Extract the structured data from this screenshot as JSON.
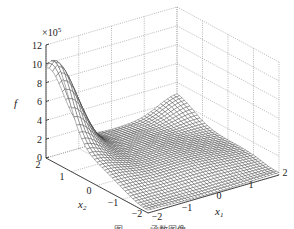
{
  "chart_data": {
    "type": "surface3d",
    "title": "",
    "zlabel": "f",
    "xlabel": "x1",
    "ylabel": "x2",
    "z_multiplier": "×10^5",
    "z_ticks": [
      0,
      2,
      4,
      6,
      8,
      10,
      12
    ],
    "x1_ticks": [
      -2,
      -1,
      0,
      1,
      2
    ],
    "x2_ticks": [
      2,
      1,
      0,
      -1,
      -2
    ],
    "x1_range": [
      -2,
      2
    ],
    "x2_range": [
      -2,
      2
    ],
    "z_range": [
      0,
      12
    ],
    "grid": true,
    "grid_style": "dotted",
    "mesh_resolution": 41,
    "surface_description": "Mesh surface with peak ≈10.5×10^5 at x1=-2, x2≈1.7; low valley ≈1–2×10^5 across most of the domain; secondary rise ≈2.5×10^5 near x1=2, x2=2",
    "sample_points": [
      {
        "x1": -2,
        "x2": 2,
        "f": 9.6
      },
      {
        "x1": -2,
        "x2": 1.7,
        "f": 10.4
      },
      {
        "x1": -2,
        "x2": 1,
        "f": 7.5
      },
      {
        "x1": -2,
        "x2": 0,
        "f": 2.5
      },
      {
        "x1": -2,
        "x2": -2,
        "f": 0.3
      },
      {
        "x1": 0,
        "x2": 0,
        "f": 1.2
      },
      {
        "x1": 2,
        "x2": -2,
        "f": 0.2
      },
      {
        "x1": 2,
        "x2": 2,
        "f": 2.5
      }
    ]
  },
  "labels": {
    "z_axis": "f",
    "z_exponent_prefix": "×10",
    "z_exponent": "5",
    "x1_base": "x",
    "x1_sub": "1",
    "x2_base": "x",
    "x2_sub": "2",
    "z_ticks": [
      "0",
      "2",
      "4",
      "6",
      "8",
      "10",
      "12"
    ],
    "x2_ticks": [
      "2",
      "1",
      "0",
      "−1",
      "−2"
    ],
    "x1_ticks": [
      "−2",
      "−1",
      "0",
      "1",
      "2"
    ],
    "caption": "图 … … 函数图像"
  },
  "colors": {
    "mesh_line": "#2a2a2a",
    "surface_fill": "#ffffff",
    "grid": "#8a8a8a",
    "axis": "#222222",
    "background": "#ffffff"
  }
}
